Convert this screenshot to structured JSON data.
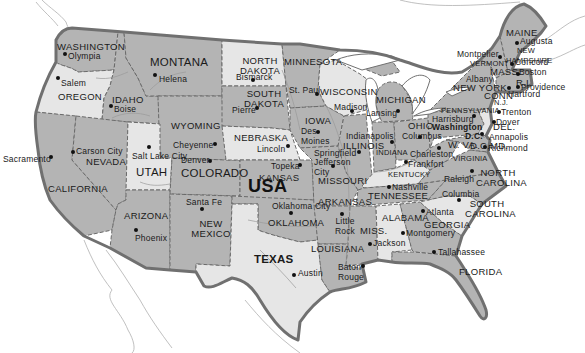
{
  "map": {
    "title": "USA",
    "colors": {
      "dark_state": "#b4b4b4",
      "mid_state": "#c8c8c8",
      "light_state": "#e6e6e6",
      "border": "#6a6a6a",
      "coast": "#707070",
      "water": "#ffffff"
    },
    "states": [
      {
        "name": "WASHINGTON",
        "capital": "Olympia"
      },
      {
        "name": "OREGON",
        "capital": "Salem"
      },
      {
        "name": "CALIFORNIA",
        "capital": "Sacramento"
      },
      {
        "name": "NEVADA",
        "capital": "Carson City"
      },
      {
        "name": "IDAHO",
        "capital": "Boise"
      },
      {
        "name": "MONTANA",
        "capital": "Helena"
      },
      {
        "name": "WYOMING",
        "capital": "Cheyenne"
      },
      {
        "name": "UTAH",
        "capital": "Salt Lake City"
      },
      {
        "name": "ARIZONA",
        "capital": "Phoenix"
      },
      {
        "name": "COLORADO",
        "capital": "Denver"
      },
      {
        "name": "NEW MEXICO",
        "capital": "Santa Fe"
      },
      {
        "name": "NORTH DAKOTA",
        "capital": "Bismarck"
      },
      {
        "name": "SOUTH DAKOTA",
        "capital": "Pierre"
      },
      {
        "name": "NEBRASKA",
        "capital": "Lincoln"
      },
      {
        "name": "KANSAS",
        "capital": "Topeka"
      },
      {
        "name": "OKLAHOMA",
        "capital": "Oklahoma City"
      },
      {
        "name": "TEXAS",
        "capital": "Austin"
      },
      {
        "name": "MINNESOTA",
        "capital": "St. Paul"
      },
      {
        "name": "IOWA",
        "capital": "Des Moines"
      },
      {
        "name": "MISSOURI",
        "capital": "Jefferson City"
      },
      {
        "name": "ARKANSAS",
        "capital": "Little Rock"
      },
      {
        "name": "LOUISIANA",
        "capital": "Baton Rouge"
      },
      {
        "name": "WISCONSIN",
        "capital": "Madison"
      },
      {
        "name": "ILLINOIS",
        "capital": "Springfield"
      },
      {
        "name": "MICHIGAN",
        "capital": "Lansing"
      },
      {
        "name": "INDIANA",
        "capital": "Indianapolis"
      },
      {
        "name": "OHIO",
        "capital": "Columbus"
      },
      {
        "name": "KENTUCKY",
        "capital": "Frankfort"
      },
      {
        "name": "TENNESSEE",
        "capital": "Nashville"
      },
      {
        "name": "MISS.",
        "capital": "Jackson"
      },
      {
        "name": "ALABAMA",
        "capital": "Montgomery"
      },
      {
        "name": "GEORGIA",
        "capital": "Atlanta"
      },
      {
        "name": "FLORIDA",
        "capital": "Tallahassee"
      },
      {
        "name": "SOUTH CAROLINA",
        "capital": "Columbia"
      },
      {
        "name": "NORTH CAROLINA",
        "capital": "Raleigh"
      },
      {
        "name": "VIRGINIA",
        "capital": "Richmond"
      },
      {
        "name": "W. VA.",
        "capital": "Charleston"
      },
      {
        "name": "MD.",
        "capital": "Annapolis"
      },
      {
        "name": "DEL.",
        "capital": "Dover"
      },
      {
        "name": "N.J.",
        "capital": "Trenton"
      },
      {
        "name": "PENNSYLVANIA",
        "capital": "Harrisburg"
      },
      {
        "name": "NEW YORK",
        "capital": "Albany"
      },
      {
        "name": "CONN",
        "capital": "Hartford"
      },
      {
        "name": "R.I.",
        "capital": "Providence"
      },
      {
        "name": "MASS.",
        "capital": "Boston"
      },
      {
        "name": "VERMONT",
        "capital": "Montpelier"
      },
      {
        "name": "NEW HAMPSHIRE",
        "capital": "Concord"
      },
      {
        "name": "MAINE",
        "capital": "Augusta"
      }
    ],
    "national_capital": {
      "line1": "Washington",
      "line2": "D.C."
    }
  }
}
